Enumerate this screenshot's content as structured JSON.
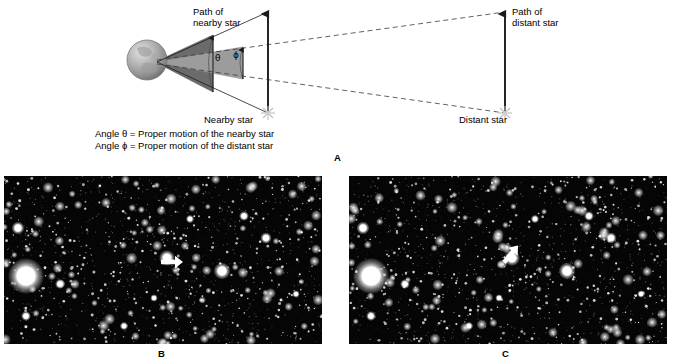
{
  "figure": {
    "panel_a": {
      "letter": "A",
      "labels": {
        "path_nearby_star": "Path of\nnearby star",
        "path_distant_star": "Path of\ndistant star",
        "nearby_star": "Nearby star",
        "distant_star": "Distant star",
        "angle_theta_symbol": "θ",
        "angle_phi_symbol": "ϕ"
      },
      "caption": "Angle θ = Proper motion of the nearby star\nAngle ϕ = Proper motion of the distant star",
      "caption_line1": "Angle θ = Proper motion of the nearby star",
      "caption_line2": "Angle ϕ = Proper motion of the distant star",
      "colors": {
        "theta_wedge": "#6b6b6b",
        "phi_wedge": "#9a9a9a",
        "line": "#1a1a1a",
        "earth_light": "#d8d8d8",
        "earth_dark": "#8a8a8a",
        "star_glyph": "#b8b8b8"
      }
    },
    "panel_b": {
      "letter": "B",
      "background": "#050505",
      "arrow_direction": "left",
      "arrow_target_star": "nearby star first epoch"
    },
    "panel_c": {
      "letter": "C",
      "background": "#050505",
      "arrow_direction": "down-left",
      "arrow_target_star": "nearby star second epoch"
    }
  }
}
